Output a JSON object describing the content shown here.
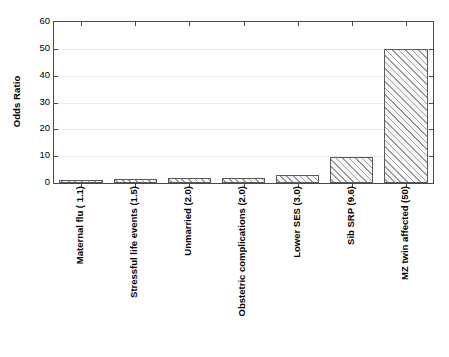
{
  "chart_data": {
    "type": "bar",
    "title": "",
    "subtitle": "",
    "xlabel": "",
    "ylabel": "Odds Ratio",
    "ylim": [
      0,
      60
    ],
    "ytick_values": [
      0,
      10,
      20,
      30,
      40,
      50,
      60
    ],
    "ytick_labels": [
      "0",
      "10",
      "20",
      "30",
      "40",
      "50",
      "60"
    ],
    "grid": "horizontal",
    "legend": "none",
    "categories": [
      "Maternal flu ( 1.1)",
      "Stressful life events (1.5)",
      "Unmarried (2.0)",
      "Obstetric complications (2.0)",
      "Lower SES (3.0)",
      "Sib SRP (9.6)",
      "MZ twin affected (50)"
    ],
    "values": [
      1.1,
      1.5,
      2.0,
      2.0,
      3.0,
      9.6,
      50
    ],
    "series": [
      {
        "name": "Odds Ratio",
        "values": [
          1.1,
          1.5,
          2.0,
          2.0,
          3.0,
          9.6,
          50
        ]
      }
    ],
    "bar_fill_color": "#c9c9c9",
    "bar_edge_color": "#5a5a5a",
    "bar_hatch": "diagonal-forward-slash",
    "axis_color": "#4a4a4a",
    "gridline_color": "#eceaea",
    "background_color": "#ffffff"
  }
}
